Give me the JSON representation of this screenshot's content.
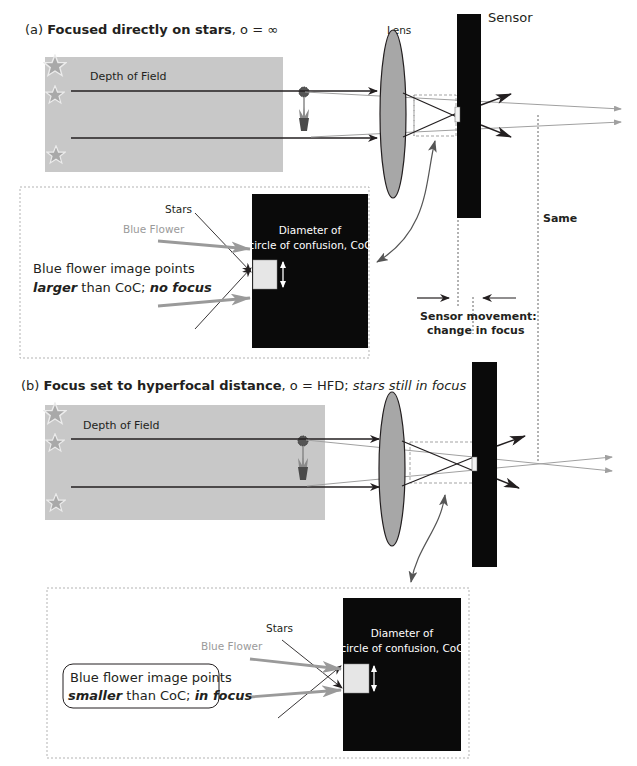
{
  "panel_a": {
    "title_prefix": "(a) ",
    "title_bold": "Focused directly on stars",
    "title_suffix": ", o = ∞",
    "depth_of_field": "Depth of Field",
    "lens_label": "Lens",
    "sensor_label": "Sensor",
    "inset": {
      "stars": "Stars",
      "blue_flower": "Blue Flower",
      "coc_line1": "Diameter of",
      "coc_line2": "circle of confusion, CoC",
      "caption_line1": "Blue flower image points",
      "caption_line2_em": "larger",
      "caption_line2_mid": " than CoC; ",
      "caption_line2_bold": "no focus"
    }
  },
  "middle": {
    "same_label": "Same",
    "movement_line1": "Sensor movement:",
    "movement_line2": "change in focus"
  },
  "panel_b": {
    "title_prefix": "(b) ",
    "title_bold": "Focus set to hyperfocal distance",
    "title_mid": ", o = HFD; ",
    "title_ital": "stars still in focus",
    "depth_of_field": "Depth of Field",
    "inset": {
      "stars": "Stars",
      "blue_flower": "Blue Flower",
      "coc_line1": "Diameter of",
      "coc_line2": "circle of confusion, CoC",
      "caption_line1": "Blue flower image points",
      "caption_line2_em": "smaller",
      "caption_line2_mid": " than CoC; ",
      "caption_line2_bold": "in focus"
    }
  },
  "colors": {
    "dof_box": "#c8c8c8",
    "star": "#a9a9a9",
    "lens": "#a7a7a7",
    "sensor": "#0a0a0a",
    "ray_dark": "#231f20",
    "ray_light": "#a0a0a0",
    "coc_square": "#e6e6e6"
  }
}
